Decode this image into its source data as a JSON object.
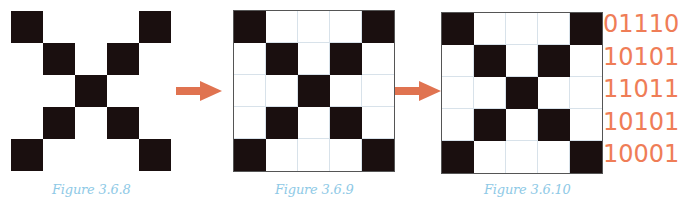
{
  "figures": [
    {
      "caption": "Figure 3.6.8",
      "show_grid_lines": false,
      "pattern": [
        [
          1,
          0,
          0,
          0,
          1
        ],
        [
          0,
          1,
          0,
          1,
          0
        ],
        [
          0,
          0,
          1,
          0,
          0
        ],
        [
          0,
          1,
          0,
          1,
          0
        ],
        [
          1,
          0,
          0,
          0,
          1
        ]
      ]
    },
    {
      "caption": "Figure 3.6.9",
      "show_grid_lines": true,
      "pattern": [
        [
          1,
          0,
          0,
          0,
          1
        ],
        [
          0,
          1,
          0,
          1,
          0
        ],
        [
          0,
          0,
          1,
          0,
          0
        ],
        [
          0,
          1,
          0,
          1,
          0
        ],
        [
          1,
          0,
          0,
          0,
          1
        ]
      ]
    },
    {
      "caption": "Figure 3.6.10",
      "show_grid_lines": true,
      "pattern": [
        [
          1,
          0,
          0,
          0,
          1
        ],
        [
          0,
          1,
          0,
          1,
          0
        ],
        [
          0,
          0,
          1,
          0,
          0
        ],
        [
          0,
          1,
          0,
          1,
          0
        ],
        [
          1,
          0,
          0,
          0,
          1
        ]
      ]
    }
  ],
  "binary_rows": [
    "01110",
    "10101",
    "11011",
    "10101",
    "10001"
  ],
  "colors": {
    "filled_cell": "#1a0f0f",
    "arrow": "#e07350",
    "binary_text": "#ef7d57",
    "caption_text": "#8ec9e6",
    "grid_line": "#d8e2ea"
  },
  "arrows": [
    {
      "icon": "right-arrow-icon"
    },
    {
      "icon": "right-arrow-icon"
    }
  ]
}
